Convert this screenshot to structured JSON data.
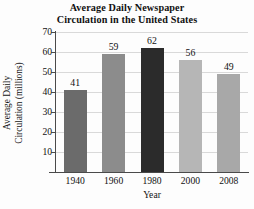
{
  "chart_data": {
    "type": "bar",
    "title": "Average Daily Newspaper Circulation in the United States",
    "title_lines": [
      "Average Daily Newspaper",
      "Circulation in the United States"
    ],
    "xlabel": "Year",
    "ylabel": "Average Daily Circulation (millions)",
    "ylabel_lines": [
      "Average Daily",
      "Circulation (millions)"
    ],
    "categories": [
      "1940",
      "1960",
      "1980",
      "2000",
      "2008"
    ],
    "values": [
      41,
      59,
      62,
      56,
      49
    ],
    "value_labels": [
      "41",
      "59",
      "62",
      "56",
      "49"
    ],
    "bar_colors": [
      "#6b6b6b",
      "#8c8c8c",
      "#2b2b2b",
      "#b6b6b6",
      "#a8a8a8"
    ],
    "ylim": [
      0,
      70
    ],
    "yticks": [
      70,
      60,
      50,
      40,
      30,
      20,
      10
    ],
    "ytick_labels": [
      "70",
      "60",
      "50",
      "40",
      "30",
      "20",
      "10"
    ],
    "grid": true,
    "grid_color": "#d9d9d9",
    "legend": null,
    "axis_color": "#4a4a4a",
    "background": "#fdfdfd"
  }
}
